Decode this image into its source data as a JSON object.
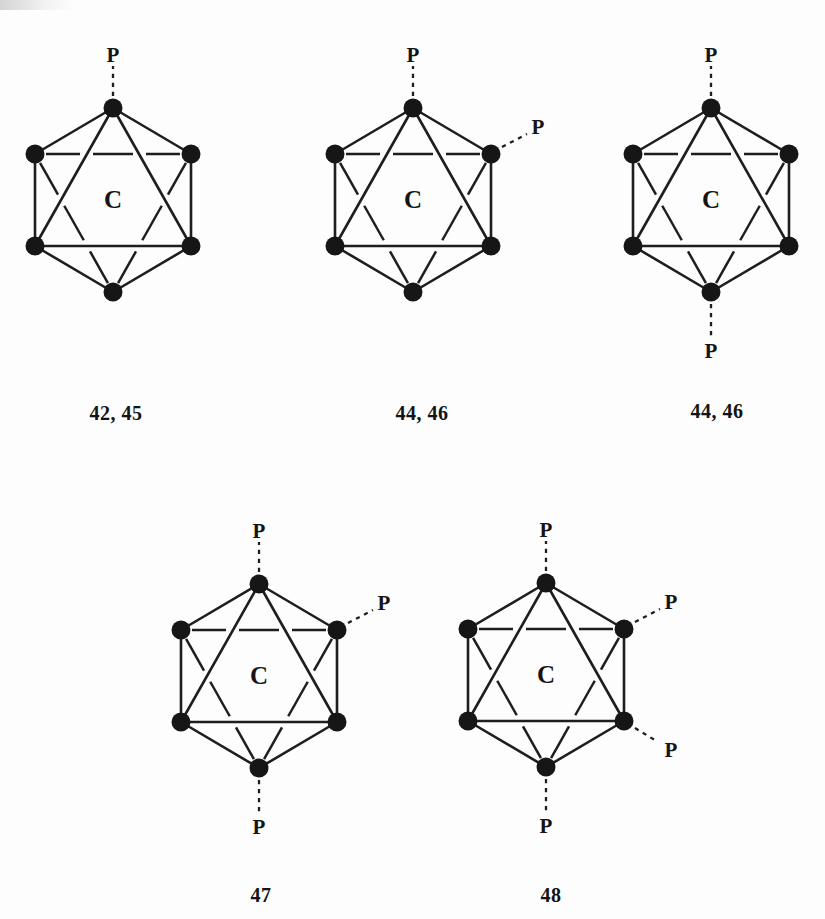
{
  "page": {
    "paper_color": "#fdfdfd",
    "ink_color": "#1e1e1e",
    "dot_color": "#161616",
    "text_color": "#141414"
  },
  "figure": {
    "core_label": "C",
    "ligand_label": "P",
    "clusters": [
      {
        "name": "cluster-42-45",
        "caption": "42, 45",
        "ligands": [
          "top"
        ],
        "center": {
          "x": 113,
          "y": 200
        },
        "caption_at": {
          "x": 116,
          "y": 420
        }
      },
      {
        "name": "cluster-44-46-cis",
        "caption": "44, 46",
        "ligands": [
          "top",
          "upper-right"
        ],
        "center": {
          "x": 413,
          "y": 200
        },
        "caption_at": {
          "x": 422,
          "y": 420
        }
      },
      {
        "name": "cluster-44-46-trans",
        "caption": "44, 46",
        "ligands": [
          "top",
          "bottom"
        ],
        "center": {
          "x": 711,
          "y": 200
        },
        "caption_at": {
          "x": 717,
          "y": 418
        }
      },
      {
        "name": "cluster-47",
        "caption": "47",
        "ligands": [
          "top",
          "upper-right",
          "bottom"
        ],
        "center": {
          "x": 259,
          "y": 676
        },
        "caption_at": {
          "x": 261,
          "y": 902
        }
      },
      {
        "name": "cluster-48",
        "caption": "48",
        "ligands": [
          "top",
          "upper-right",
          "lower-right",
          "bottom"
        ],
        "center": {
          "x": 546,
          "y": 675
        },
        "caption_at": {
          "x": 551,
          "y": 902
        }
      }
    ]
  }
}
